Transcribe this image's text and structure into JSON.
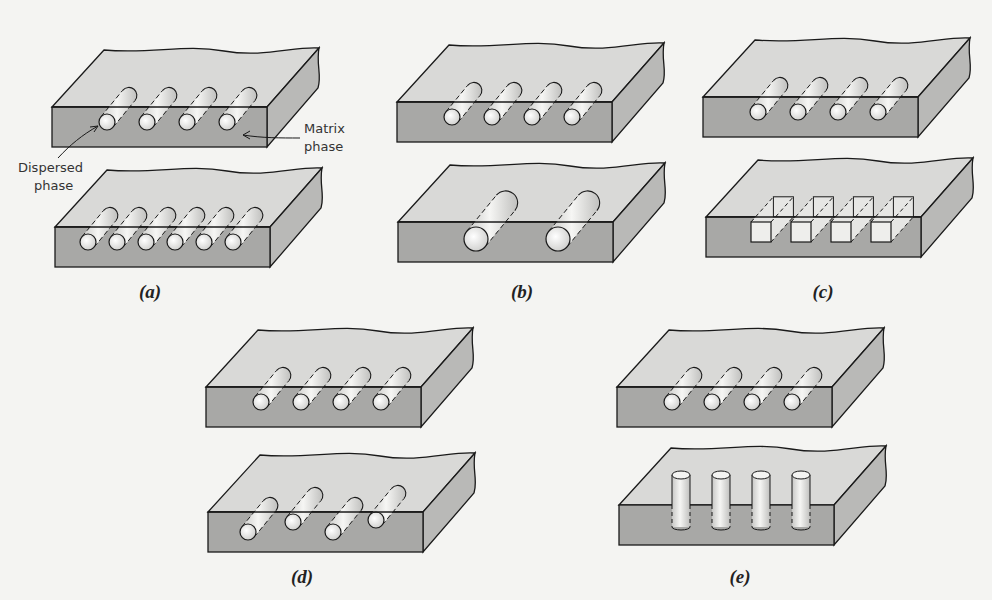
{
  "figure": {
    "panels": [
      {
        "id": "a",
        "caption": "(a)",
        "slabs": [
          {
            "x": 52,
            "y": 50,
            "fibers": 4,
            "shape": "cylinder",
            "size": "small",
            "spacing": "wide"
          },
          {
            "x": 55,
            "y": 170,
            "fibers": 6,
            "shape": "cylinder",
            "size": "small",
            "spacing": "close"
          }
        ]
      },
      {
        "id": "b",
        "caption": "(b)",
        "slabs": [
          {
            "x": 397,
            "y": 45,
            "fibers": 4,
            "shape": "cylinder",
            "size": "small"
          },
          {
            "x": 398,
            "y": 165,
            "fibers": 2,
            "shape": "cylinder",
            "size": "large"
          }
        ]
      },
      {
        "id": "c",
        "caption": "(c)",
        "slabs": [
          {
            "x": 703,
            "y": 40,
            "fibers": 4,
            "shape": "cylinder"
          },
          {
            "x": 706,
            "y": 160,
            "fibers": 4,
            "shape": "square"
          }
        ]
      },
      {
        "id": "d",
        "caption": "(d)",
        "slabs": [
          {
            "x": 206,
            "y": 330,
            "fibers": 4,
            "shape": "cylinder",
            "distribution": "uniform"
          },
          {
            "x": 208,
            "y": 455,
            "fibers": 4,
            "shape": "cylinder",
            "distribution": "staggered"
          }
        ]
      },
      {
        "id": "e",
        "caption": "(e)",
        "slabs": [
          {
            "x": 617,
            "y": 330,
            "fibers": 4,
            "shape": "cylinder",
            "orientation": "parallel"
          },
          {
            "x": 619,
            "y": 448,
            "fibers": 4,
            "shape": "cylinder",
            "orientation": "vertical"
          }
        ]
      }
    ],
    "labels": {
      "matrix_phase": [
        "Matrix",
        "phase"
      ],
      "dispersed_phase": [
        "Dispersed",
        "phase"
      ]
    },
    "colors": {
      "top_face": "#d9d9d7",
      "front_face": "#a8a8a6",
      "side_face": "#b9b9b7",
      "outline": "#1a1a1a",
      "fiber": "#ececea"
    }
  }
}
